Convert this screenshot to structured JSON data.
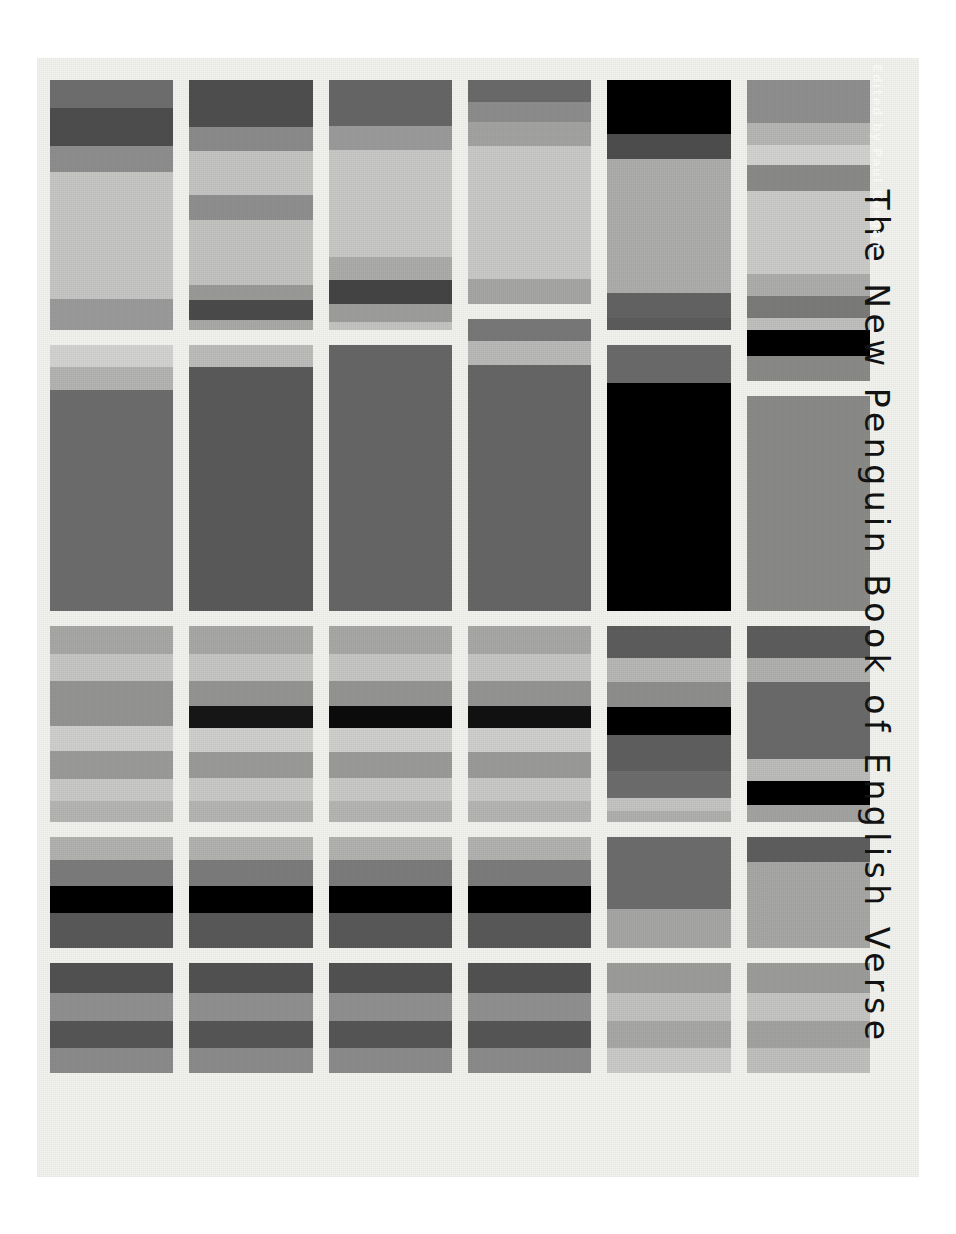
{
  "cover": {
    "title": "The New Penguin Book of English Verse",
    "editor_credit": "Edited by Paul Keegan",
    "background_color": "#f2f2ee",
    "page_background": "#ffffff",
    "title_color": "#121212",
    "editor_color": "#fbfbf8",
    "orientation": "rotated-90-clockwise",
    "grid": {
      "columns": 6,
      "rows": 5,
      "column_gap_px": 16,
      "row_gap_px": 15
    }
  },
  "chart_data": {
    "type": "heatmap",
    "title": "The New Penguin Book of English Verse",
    "xlabel": "",
    "ylabel": "",
    "grid": false,
    "legend_position": "none",
    "columns": 6,
    "rows": 5,
    "cells": [
      {
        "col": 1,
        "row": 1,
        "height_px": 250,
        "stripes": [
          {
            "color": "#6e6e6e",
            "h": 28
          },
          {
            "color": "#4d4d4d",
            "h": 38
          },
          {
            "color": "#8e8e8e",
            "h": 26
          },
          {
            "color": "#c6c6c4",
            "h": 127
          },
          {
            "color": "#9b9b9b",
            "h": 31
          }
        ]
      },
      {
        "col": 1,
        "row": 2,
        "height_px": 266,
        "stripes": [
          {
            "color": "#d3d3d1",
            "h": 22
          },
          {
            "color": "#b4b4b2",
            "h": 23
          },
          {
            "color": "#6d6d6d",
            "h": 221
          }
        ]
      },
      {
        "col": 1,
        "row": 3,
        "height_px": 196,
        "stripes": [
          {
            "color": "#a8a8a6",
            "h": 28
          },
          {
            "color": "#c6c6c4",
            "h": 27
          },
          {
            "color": "#949492",
            "h": 45
          },
          {
            "color": "#cfcfcd",
            "h": 25
          },
          {
            "color": "#9b9b99",
            "h": 28
          },
          {
            "color": "#c9c9c7",
            "h": 22
          },
          {
            "color": "#b5b5b3",
            "h": 21
          }
        ]
      },
      {
        "col": 1,
        "row": 4,
        "height_px": 111,
        "stripes": [
          {
            "color": "#b2b2b0",
            "h": 23
          },
          {
            "color": "#7c7c7c",
            "h": 26
          },
          {
            "color": "#000000",
            "h": 27
          },
          {
            "color": "#595959",
            "h": 35
          }
        ]
      },
      {
        "col": 1,
        "row": 5,
        "height_px": 110,
        "stripes": [
          {
            "color": "#525252",
            "h": 30
          },
          {
            "color": "#909090",
            "h": 28
          },
          {
            "color": "#565656",
            "h": 27
          },
          {
            "color": "#8b8b8b",
            "h": 25
          }
        ]
      },
      {
        "col": 2,
        "row": 1,
        "height_px": 250,
        "stripes": [
          {
            "color": "#4f4f4f",
            "h": 47
          },
          {
            "color": "#8b8b8b",
            "h": 24
          },
          {
            "color": "#c4c4c2",
            "h": 44
          },
          {
            "color": "#8f8f8f",
            "h": 25
          },
          {
            "color": "#c3c3c1",
            "h": 65
          },
          {
            "color": "#9a9a98",
            "h": 15
          },
          {
            "color": "#4b4b4b",
            "h": 20
          },
          {
            "color": "#a9a9a7",
            "h": 10
          }
        ]
      },
      {
        "col": 2,
        "row": 2,
        "height_px": 266,
        "stripes": [
          {
            "color": "#bcbcba",
            "h": 22
          },
          {
            "color": "#5a5a5a",
            "h": 244
          }
        ]
      },
      {
        "col": 2,
        "row": 3,
        "height_px": 196,
        "stripes": [
          {
            "color": "#a8a8a6",
            "h": 28
          },
          {
            "color": "#c6c6c4",
            "h": 27
          },
          {
            "color": "#949492",
            "h": 25
          },
          {
            "color": "#161616",
            "h": 22
          },
          {
            "color": "#cfcfcd",
            "h": 24
          },
          {
            "color": "#9b9b99",
            "h": 26
          },
          {
            "color": "#c9c9c7",
            "h": 23
          },
          {
            "color": "#b5b5b3",
            "h": 21
          }
        ]
      },
      {
        "col": 2,
        "row": 4,
        "height_px": 111,
        "stripes": [
          {
            "color": "#b2b2b0",
            "h": 23
          },
          {
            "color": "#7c7c7c",
            "h": 26
          },
          {
            "color": "#000000",
            "h": 27
          },
          {
            "color": "#595959",
            "h": 35
          }
        ]
      },
      {
        "col": 2,
        "row": 5,
        "height_px": 110,
        "stripes": [
          {
            "color": "#525252",
            "h": 30
          },
          {
            "color": "#909090",
            "h": 28
          },
          {
            "color": "#565656",
            "h": 27
          },
          {
            "color": "#8b8b8b",
            "h": 25
          }
        ]
      },
      {
        "col": 3,
        "row": 1,
        "height_px": 250,
        "stripes": [
          {
            "color": "#666666",
            "h": 46
          },
          {
            "color": "#9b9b9b",
            "h": 24
          },
          {
            "color": "#c8c8c6",
            "h": 107
          },
          {
            "color": "#acacaa",
            "h": 23
          },
          {
            "color": "#444444",
            "h": 24
          },
          {
            "color": "#9e9e9c",
            "h": 18
          },
          {
            "color": "#c4c4c2",
            "h": 8
          }
        ]
      },
      {
        "col": 3,
        "row": 2,
        "height_px": 266,
        "stripes": [
          {
            "color": "#666666",
            "h": 266
          }
        ]
      },
      {
        "col": 3,
        "row": 3,
        "height_px": 196,
        "stripes": [
          {
            "color": "#a8a8a6",
            "h": 28
          },
          {
            "color": "#c6c6c4",
            "h": 27
          },
          {
            "color": "#949492",
            "h": 25
          },
          {
            "color": "#0b0b0b",
            "h": 22
          },
          {
            "color": "#cfcfcd",
            "h": 24
          },
          {
            "color": "#9b9b99",
            "h": 26
          },
          {
            "color": "#c9c9c7",
            "h": 23
          },
          {
            "color": "#b5b5b3",
            "h": 21
          }
        ]
      },
      {
        "col": 3,
        "row": 4,
        "height_px": 111,
        "stripes": [
          {
            "color": "#b2b2b0",
            "h": 23
          },
          {
            "color": "#7c7c7c",
            "h": 26
          },
          {
            "color": "#000000",
            "h": 27
          },
          {
            "color": "#595959",
            "h": 35
          }
        ]
      },
      {
        "col": 3,
        "row": 5,
        "height_px": 110,
        "stripes": [
          {
            "color": "#525252",
            "h": 30
          },
          {
            "color": "#909090",
            "h": 28
          },
          {
            "color": "#565656",
            "h": 27
          },
          {
            "color": "#8b8b8b",
            "h": 25
          }
        ]
      },
      {
        "col": 4,
        "row": 1,
        "height_px": 224,
        "stripes": [
          {
            "color": "#6a6a6a",
            "h": 22
          },
          {
            "color": "#8d8d8d",
            "h": 20
          },
          {
            "color": "#a3a3a1",
            "h": 24
          },
          {
            "color": "#c9c9c7",
            "h": 133
          },
          {
            "color": "#a6a6a4",
            "h": 25
          }
        ]
      },
      {
        "col": 4,
        "row": 2,
        "height_px": 292,
        "stripes": [
          {
            "color": "#787878",
            "h": 22
          },
          {
            "color": "#b9b9b7",
            "h": 24
          },
          {
            "color": "#666666",
            "h": 246
          }
        ]
      },
      {
        "col": 4,
        "row": 3,
        "height_px": 196,
        "stripes": [
          {
            "color": "#a8a8a6",
            "h": 28
          },
          {
            "color": "#c6c6c4",
            "h": 27
          },
          {
            "color": "#949492",
            "h": 25
          },
          {
            "color": "#111111",
            "h": 22
          },
          {
            "color": "#cfcfcd",
            "h": 24
          },
          {
            "color": "#9b9b99",
            "h": 26
          },
          {
            "color": "#c9c9c7",
            "h": 23
          },
          {
            "color": "#b5b5b3",
            "h": 21
          }
        ]
      },
      {
        "col": 4,
        "row": 4,
        "height_px": 111,
        "stripes": [
          {
            "color": "#b2b2b0",
            "h": 23
          },
          {
            "color": "#7c7c7c",
            "h": 26
          },
          {
            "color": "#000000",
            "h": 27
          },
          {
            "color": "#595959",
            "h": 35
          }
        ]
      },
      {
        "col": 4,
        "row": 5,
        "height_px": 110,
        "stripes": [
          {
            "color": "#525252",
            "h": 30
          },
          {
            "color": "#909090",
            "h": 28
          },
          {
            "color": "#565656",
            "h": 27
          },
          {
            "color": "#8b8b8b",
            "h": 25
          }
        ]
      },
      {
        "col": 5,
        "row": 1,
        "height_px": 250,
        "stripes": [
          {
            "color": "#000000",
            "h": 54
          },
          {
            "color": "#4d4d4d",
            "h": 25
          },
          {
            "color": "#adadab",
            "h": 134
          },
          {
            "color": "#636363",
            "h": 25
          },
          {
            "color": "#5c5c5c",
            "h": 12
          }
        ]
      },
      {
        "col": 5,
        "row": 2,
        "height_px": 266,
        "stripes": [
          {
            "color": "#6a6a6a",
            "h": 38
          },
          {
            "color": "#000000",
            "h": 228
          }
        ]
      },
      {
        "col": 5,
        "row": 3,
        "height_px": 196,
        "stripes": [
          {
            "color": "#5d5d5d",
            "h": 32
          },
          {
            "color": "#b7b7b5",
            "h": 24
          },
          {
            "color": "#8e8e8c",
            "h": 25
          },
          {
            "color": "#000000",
            "h": 28
          },
          {
            "color": "#5f5f5f",
            "h": 36
          },
          {
            "color": "#6d6d6d",
            "h": 27
          },
          {
            "color": "#c4c4c2",
            "h": 13
          },
          {
            "color": "#b0b0ae",
            "h": 11
          }
        ]
      },
      {
        "col": 5,
        "row": 4,
        "height_px": 111,
        "stripes": [
          {
            "color": "#6d6d6d",
            "h": 72
          },
          {
            "color": "#a6a6a4",
            "h": 39
          }
        ]
      },
      {
        "col": 5,
        "row": 5,
        "height_px": 110,
        "stripes": [
          {
            "color": "#9c9c9a",
            "h": 30
          },
          {
            "color": "#c2c2c0",
            "h": 28
          },
          {
            "color": "#a8a8a6",
            "h": 27
          },
          {
            "color": "#cacac8",
            "h": 25
          }
        ]
      },
      {
        "col": 6,
        "row": 1,
        "height_px": 301,
        "stripes": [
          {
            "color": "#8f8f8f",
            "h": 43
          },
          {
            "color": "#b6b6b4",
            "h": 22
          },
          {
            "color": "#d2d2d0",
            "h": 20
          },
          {
            "color": "#8a8a88",
            "h": 26
          },
          {
            "color": "#cbcbc9",
            "h": 83
          },
          {
            "color": "#adadab",
            "h": 22
          },
          {
            "color": "#7b7b79",
            "h": 22
          },
          {
            "color": "#c0c0be",
            "h": 12
          },
          {
            "color": "#000000",
            "h": 26
          },
          {
            "color": "#8a8a88",
            "h": 25
          }
        ]
      },
      {
        "col": 6,
        "row": 2,
        "height_px": 215,
        "stripes": [
          {
            "color": "#8a8a88",
            "h": 215
          }
        ]
      },
      {
        "col": 6,
        "row": 3,
        "height_px": 196,
        "stripes": [
          {
            "color": "#5d5d5d",
            "h": 32
          },
          {
            "color": "#b0b0ae",
            "h": 24
          },
          {
            "color": "#6a6a6a",
            "h": 77
          },
          {
            "color": "#bcbcba",
            "h": 22
          },
          {
            "color": "#000000",
            "h": 24
          },
          {
            "color": "#a3a3a1",
            "h": 17
          }
        ]
      },
      {
        "col": 6,
        "row": 4,
        "height_px": 111,
        "stripes": [
          {
            "color": "#5e5e5e",
            "h": 25
          },
          {
            "color": "#a7a7a5",
            "h": 86
          }
        ]
      },
      {
        "col": 6,
        "row": 5,
        "height_px": 110,
        "stripes": [
          {
            "color": "#9c9c9a",
            "h": 30
          },
          {
            "color": "#c5c5c3",
            "h": 28
          },
          {
            "color": "#a2a2a0",
            "h": 27
          },
          {
            "color": "#c0c0be",
            "h": 25
          }
        ]
      }
    ]
  }
}
